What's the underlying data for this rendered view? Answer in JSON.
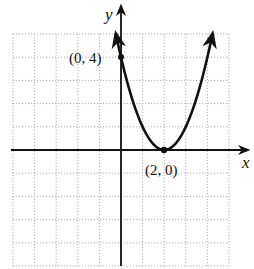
{
  "chart_data": {
    "type": "line",
    "title": "",
    "xlabel": "x",
    "ylabel": "y",
    "xlim": [
      -5,
      5
    ],
    "ylim": [
      -5,
      5
    ],
    "grid": true,
    "grid_style": "dotted",
    "series": [
      {
        "name": "y = (x - 2)^2",
        "x": [
          -0.24,
          0,
          0.5,
          1,
          1.5,
          2,
          2.5,
          3,
          3.5,
          4,
          4.24
        ],
        "values": [
          5.0,
          4,
          2.25,
          1,
          0.25,
          0,
          0.25,
          1,
          2.25,
          4,
          5.0
        ]
      }
    ],
    "labeled_points": [
      {
        "label": "(0, 4)",
        "x": 0,
        "y": 4
      },
      {
        "label": "(2, 0)",
        "x": 2,
        "y": 0
      }
    ],
    "colors": {
      "curve": "#111111",
      "grid": "#9a9a9a",
      "axes": "#111111"
    }
  },
  "labels": {
    "x_axis": "x",
    "y_axis": "y",
    "point_y_intercept": "(0, 4)",
    "point_vertex": "(2, 0)"
  }
}
